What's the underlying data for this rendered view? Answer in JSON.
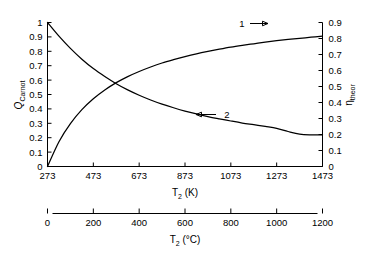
{
  "chart_data": {
    "type": "line",
    "title": "",
    "xlabel": "T_2 (K)",
    "ylabel": "Q_Carnot",
    "y2label": "eta_theor",
    "grid": false,
    "legend_position": "inline-annotations",
    "axes": {
      "x_primary": {
        "label": "T₂ (K)",
        "unit": "K",
        "min": 273,
        "max": 1473,
        "step": 200,
        "ticks": [
          273,
          473,
          673,
          873,
          1073,
          1273,
          1473
        ],
        "tick_labels": [
          "273",
          "473",
          "673",
          "873",
          "1073",
          "1273",
          "1473"
        ]
      },
      "x_secondary": {
        "label": "T₂ (°C)",
        "unit": "°C",
        "min": 0,
        "max": 1200,
        "step": 200,
        "ticks": [
          0,
          200,
          400,
          600,
          800,
          1000,
          1200
        ],
        "tick_labels": [
          "0",
          "200",
          "400",
          "600",
          "800",
          "1000",
          "1200"
        ]
      },
      "y_left": {
        "label": "Q",
        "label_subscript": "Carnot",
        "min": 0,
        "max": 1,
        "step": 0.1,
        "ticks": [
          0,
          0.1,
          0.2,
          0.3,
          0.4,
          0.5,
          0.6,
          0.7,
          0.8,
          0.9,
          1
        ],
        "tick_labels": [
          "0",
          "0.1",
          "0.2",
          "0.3",
          "0.4",
          "0.5",
          "0.6",
          "0.7",
          "0.8",
          "0.9",
          "1"
        ]
      },
      "y_right": {
        "label": "η",
        "label_subscript": "theor",
        "min": 0,
        "max": 0.9,
        "step": 0.1,
        "ticks": [
          0,
          0.1,
          0.2,
          0.3,
          0.4,
          0.5,
          0.6,
          0.7,
          0.8,
          0.9
        ],
        "tick_labels": [
          "0",
          "0.1",
          "0.2",
          "0.3",
          "0.4",
          "0.5",
          "0.6",
          "0.7",
          "0.8",
          "0.9"
        ]
      }
    },
    "series": [
      {
        "name": "1",
        "annotation_label": "1",
        "arrow_direction": "right",
        "axis": "y_right",
        "description": "theoretical Carnot efficiency rising with T2",
        "x": [
          273,
          323,
          373,
          423,
          473,
          523,
          573,
          623,
          673,
          723,
          773,
          823,
          873,
          923,
          973,
          1023,
          1073,
          1123,
          1173,
          1223,
          1273,
          1323,
          1373,
          1423,
          1473
        ],
        "values": [
          0,
          0.155,
          0.268,
          0.355,
          0.423,
          0.478,
          0.524,
          0.562,
          0.594,
          0.622,
          0.647,
          0.668,
          0.687,
          0.704,
          0.719,
          0.733,
          0.746,
          0.757,
          0.767,
          0.777,
          0.786,
          0.794,
          0.801,
          0.808,
          0.815
        ]
      },
      {
        "name": "2",
        "annotation_label": "2",
        "arrow_direction": "left",
        "axis": "y_left",
        "description": "relative Carnot heat input decaying to plateau",
        "x": [
          273,
          323,
          373,
          423,
          473,
          523,
          573,
          623,
          673,
          723,
          773,
          823,
          873,
          923,
          973,
          1023,
          1073,
          1123,
          1173,
          1223,
          1273,
          1323,
          1373,
          1423,
          1473
        ],
        "values": [
          1.0,
          0.905,
          0.82,
          0.745,
          0.68,
          0.625,
          0.575,
          0.532,
          0.495,
          0.462,
          0.433,
          0.408,
          0.385,
          0.365,
          0.347,
          0.331,
          0.316,
          0.302,
          0.29,
          0.278,
          0.265,
          0.243,
          0.225,
          0.22,
          0.22
        ]
      }
    ],
    "annotations": [
      {
        "label": "1",
        "arrow": "→"
      },
      {
        "label": "2",
        "arrow": "←"
      }
    ],
    "colors": {
      "curve": "#000000",
      "axis": "#000000",
      "background": "#ffffff"
    }
  }
}
